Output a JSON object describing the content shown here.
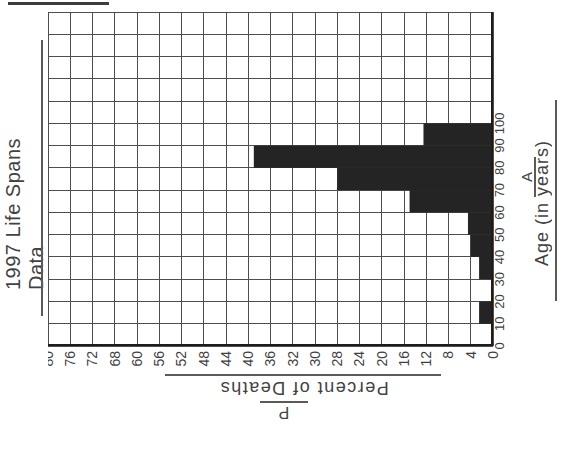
{
  "title": {
    "text": "1997 Life Spans Data"
  },
  "y_axis": {
    "symbol": "P",
    "label": "Percent of Deaths",
    "tick_labels": [
      "80",
      "76",
      "72",
      "68",
      "60",
      "56",
      "52",
      "48",
      "44",
      "40",
      "36",
      "32",
      "30",
      "28",
      "24",
      "20",
      "16",
      "12",
      "8",
      "4",
      "0"
    ]
  },
  "x_axis": {
    "symbol": "A",
    "label": "Age (in years)",
    "tick_labels": [
      "0",
      "10",
      "20",
      "30",
      "40",
      "50",
      "60",
      "70",
      "80",
      "90",
      "100"
    ]
  },
  "chart_data": {
    "type": "bar",
    "title": "1997 Life Spans Data",
    "xlabel": "Age (in years)",
    "ylabel": "Percent of Deaths",
    "categories": [
      "0-10",
      "10-20",
      "20-30",
      "30-40",
      "40-50",
      "50-60",
      "60-70",
      "70-80",
      "80-90",
      "90-100"
    ],
    "values": [
      0,
      2.5,
      0,
      2.5,
      4,
      4.5,
      15,
      28,
      43,
      12.5
    ],
    "xlim": [
      0,
      100
    ],
    "ylim": [
      0,
      80
    ],
    "x_tick_step": 10,
    "y_tick_step": 4,
    "grid": "on",
    "y_tick_labels_as_printed": [
      "80",
      "76",
      "72",
      "68",
      "60",
      "56",
      "52",
      "48",
      "44",
      "40",
      "36",
      "32",
      "30",
      "28",
      "24",
      "20",
      "16",
      "12",
      "8",
      "4",
      "0"
    ],
    "layout_note": "Image shows the chart rotated 90° CCW: age axis runs up the right edge, bars extend leftward, percent axis runs along the bottom with 0 at the right"
  },
  "colors": {
    "bar": "#242424",
    "grid_line": "#4e4e4e",
    "axis_line": "#1c1c1c",
    "text": "#3f3f3f",
    "background": "#ffffff"
  }
}
